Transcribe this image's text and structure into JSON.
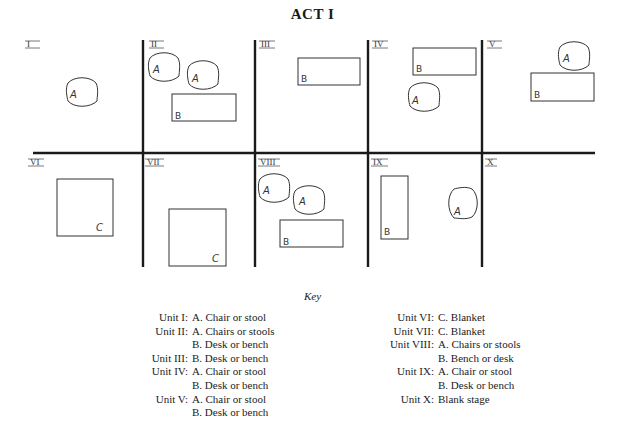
{
  "title": "ACT I",
  "stage": {
    "units": [
      {
        "id": "I",
        "label": "I",
        "pieces": [
          {
            "type": "chair",
            "letter": "A"
          }
        ]
      },
      {
        "id": "II",
        "label": "II",
        "pieces": [
          {
            "type": "chair",
            "letter": "A"
          },
          {
            "type": "chair",
            "letter": "A"
          },
          {
            "type": "desk",
            "letter": "B"
          }
        ]
      },
      {
        "id": "III",
        "label": "III",
        "pieces": [
          {
            "type": "desk",
            "letter": "B"
          }
        ]
      },
      {
        "id": "IV",
        "label": "IV",
        "pieces": [
          {
            "type": "desk",
            "letter": "B"
          },
          {
            "type": "chair",
            "letter": "A"
          }
        ]
      },
      {
        "id": "V",
        "label": "V",
        "pieces": [
          {
            "type": "chair",
            "letter": "A"
          },
          {
            "type": "desk",
            "letter": "B"
          }
        ]
      },
      {
        "id": "VI",
        "label": "VI",
        "pieces": [
          {
            "type": "blanket",
            "letter": "C"
          }
        ]
      },
      {
        "id": "VII",
        "label": "VII",
        "pieces": [
          {
            "type": "blanket",
            "letter": "C"
          }
        ]
      },
      {
        "id": "VIII",
        "label": "VIII",
        "pieces": [
          {
            "type": "chair",
            "letter": "A"
          },
          {
            "type": "chair",
            "letter": "A"
          },
          {
            "type": "bench",
            "letter": "B"
          }
        ]
      },
      {
        "id": "IX",
        "label": "IX",
        "pieces": [
          {
            "type": "desk",
            "letter": "B"
          },
          {
            "type": "chair",
            "letter": "A"
          }
        ]
      },
      {
        "id": "X",
        "label": "X",
        "pieces": []
      }
    ],
    "letters": {
      "A": "A",
      "B": "B",
      "C": "C"
    }
  },
  "key": {
    "title": "Key",
    "left": [
      {
        "unit": "Unit I:",
        "item": "A.  Chair or stool"
      },
      {
        "unit": "Unit II:",
        "item": "A.  Chairs or stools"
      },
      {
        "unit": "",
        "item": "B.  Desk or bench"
      },
      {
        "unit": "Unit III:",
        "item": "B.  Desk or bench"
      },
      {
        "unit": "Unit IV:",
        "item": "A.  Chair or stool"
      },
      {
        "unit": "",
        "item": "B.  Desk or bench"
      },
      {
        "unit": "Unit V:",
        "item": "A.  Chair or stool"
      },
      {
        "unit": "",
        "item": "B.  Desk or bench"
      }
    ],
    "right": [
      {
        "unit": "Unit VI:",
        "item": "C.  Blanket"
      },
      {
        "unit": "Unit VII:",
        "item": "C.  Blanket"
      },
      {
        "unit": "Unit VIII:",
        "item": "A.  Chairs or stools"
      },
      {
        "unit": "",
        "item": "B.  Bench or desk"
      },
      {
        "unit": "Unit IX:",
        "item": "A.  Chair or stool"
      },
      {
        "unit": "",
        "item": "B.  Desk or bench"
      },
      {
        "unit": "Unit X:",
        "item": "Blank stage"
      }
    ]
  }
}
